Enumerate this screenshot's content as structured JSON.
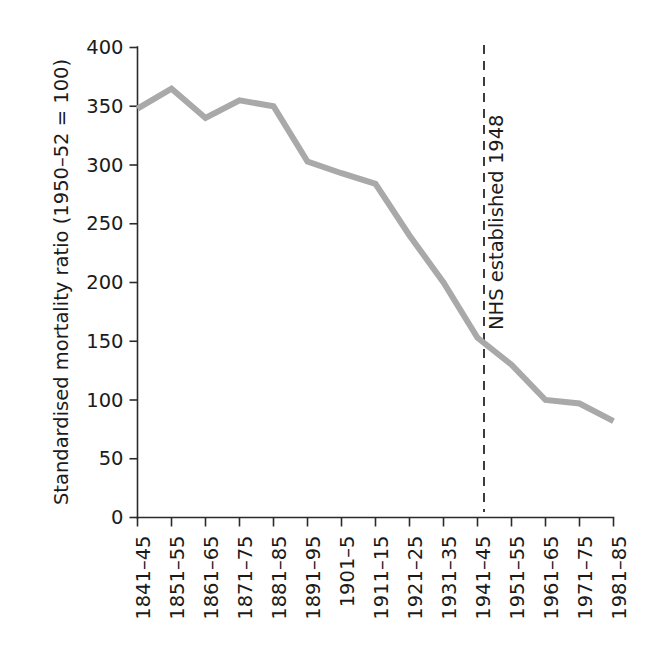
{
  "chart_data": {
    "type": "line",
    "title": "",
    "xlabel": "",
    "ylabel": "Standardised mortality ratio (1950–52 = 100)",
    "categories": [
      "1841–45",
      "1851–55",
      "1861–65",
      "1871–75",
      "1881–85",
      "1891–95",
      "1901–5",
      "1911–15",
      "1921–25",
      "1931–35",
      "1941–45",
      "1951–55",
      "1961–65",
      "1971–75",
      "1981–85"
    ],
    "values": [
      348,
      365,
      340,
      355,
      350,
      303,
      293,
      284,
      240,
      200,
      153,
      130,
      100,
      97,
      82
    ],
    "ylim": [
      0,
      400
    ],
    "yticks": [
      0,
      50,
      100,
      150,
      200,
      250,
      300,
      350,
      400
    ],
    "ytick_labels": [
      "0",
      "50",
      "100",
      "150",
      "200",
      "250",
      "300",
      "350",
      "400"
    ],
    "grid": false,
    "legend": false,
    "legend_position": "none",
    "series_color": "#a9a9a9",
    "series_line_width": 6,
    "annotations": [
      {
        "text": "NHS established 1948",
        "type": "vertical-dashed-line-with-label",
        "x_category_between": [
          "1941–45",
          "1951–55"
        ],
        "x_value": 1948,
        "color": "#1b1b1b",
        "rotation": -90
      }
    ]
  },
  "colors": {
    "axis": "#2b2b2b",
    "text": "#1b1b1b",
    "series": "#a9a9a9",
    "background": "#ffffff"
  }
}
